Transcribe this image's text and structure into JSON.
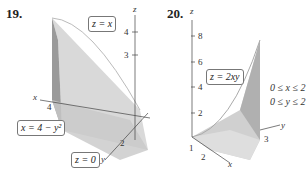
{
  "figures": [
    {
      "number": "19.",
      "labels": {
        "z_axis": "z",
        "x_axis": "x",
        "y_axis": "y"
      },
      "ticks": {
        "z": [
          "4",
          "3"
        ],
        "x": [
          "4"
        ],
        "y": [
          "2"
        ]
      },
      "callouts": [
        "z = x",
        "x = 4 − y²",
        "z = 0"
      ]
    },
    {
      "number": "20.",
      "labels": {
        "z_axis": "z",
        "x_axis": "x",
        "y_axis": "y"
      },
      "ticks": {
        "z": [
          "8",
          "6",
          "4",
          "2"
        ],
        "x": [
          "1",
          "2"
        ],
        "y": [
          "3"
        ]
      },
      "callouts": [
        "z = 2xy"
      ],
      "constraints": [
        "0 ≤ x ≤ 2",
        "0 ≤ y ≤ 2"
      ]
    }
  ]
}
